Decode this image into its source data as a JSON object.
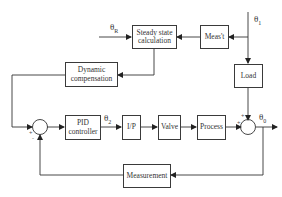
{
  "diagram": {
    "type": "block-diagram",
    "blocks": {
      "steady_state": "Steady state calculation",
      "steady_state_l1": "Steady state",
      "steady_state_l2": "calculation",
      "meast": "Meas't",
      "load": "Load",
      "dynamic_l1": "Dynamic",
      "dynamic_l2": "compensation",
      "pid_l1": "PID",
      "pid_l2": "controller",
      "ip": "I/P",
      "valve": "Valve",
      "process": "Process",
      "measurement": "Measurement"
    },
    "signals": {
      "theta_r": "θ",
      "theta_r_sub": "R",
      "theta_1": "θ",
      "theta_1_sub": "1",
      "theta_2": "θ",
      "theta_2_sub": "2",
      "theta_0": "θ",
      "theta_0_sub": "0"
    },
    "summing_junctions": [
      {
        "id": "sum1",
        "signs": [
          "+",
          "-"
        ]
      },
      {
        "id": "sum2",
        "signs": [
          "+",
          "+"
        ]
      }
    ],
    "colors": {
      "line": "#333333",
      "background": "#ffffff"
    }
  }
}
